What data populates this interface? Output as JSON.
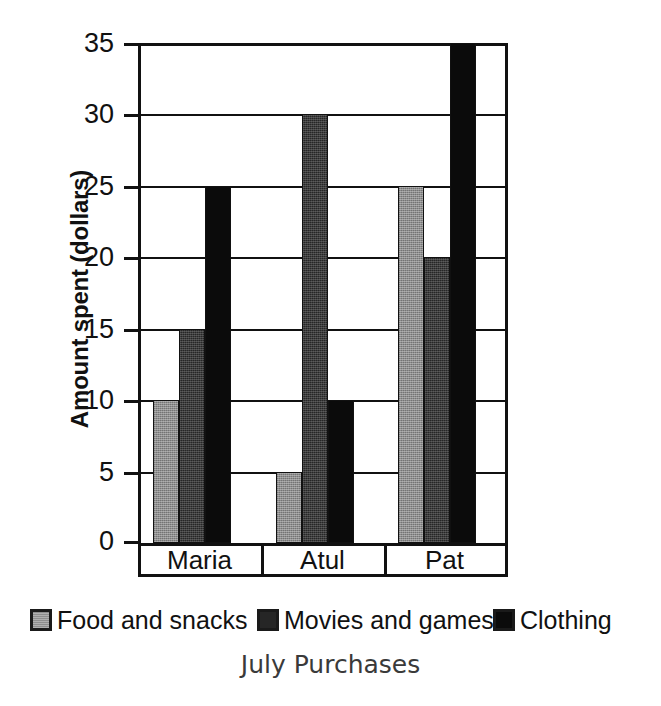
{
  "chart_data": {
    "type": "bar",
    "title": "July Purchases",
    "xlabel": "July Purchases",
    "ylabel": "Amount spent (dollars)",
    "categories": [
      "Maria",
      "Atul",
      "Pat"
    ],
    "series": [
      {
        "name": "Food and snacks",
        "color": "#8d8d8d",
        "values": [
          10,
          5,
          25
        ]
      },
      {
        "name": "Movies and games",
        "color": "#262626",
        "values": [
          15,
          30,
          20
        ]
      },
      {
        "name": "Clothing",
        "color": "#0b0b0b",
        "values": [
          25,
          10,
          35
        ]
      }
    ],
    "ylim": [
      0,
      35
    ],
    "yticks": [
      0,
      5,
      10,
      15,
      20,
      25,
      30,
      35
    ],
    "ytick_labels": [
      "0",
      "5",
      "10",
      "15",
      "20",
      "25",
      "30",
      "35"
    ],
    "grid": true,
    "grid_axis": "y",
    "legend_position": "bottom",
    "bar_group_gap": true
  },
  "axis": {
    "y_title": "Amount spent (dollars)",
    "tick_0": "0",
    "tick_5": "5",
    "tick_10": "10",
    "tick_15": "15",
    "tick_20": "20",
    "tick_25": "25",
    "tick_30": "30",
    "tick_35": "35"
  },
  "categories": {
    "c0": "Maria",
    "c1": "Atul",
    "c2": "Pat"
  },
  "legend": {
    "item0": "Food and snacks",
    "item1": "Movies and games",
    "item2": "Clothing"
  },
  "footer": {
    "title": "July Purchases"
  }
}
